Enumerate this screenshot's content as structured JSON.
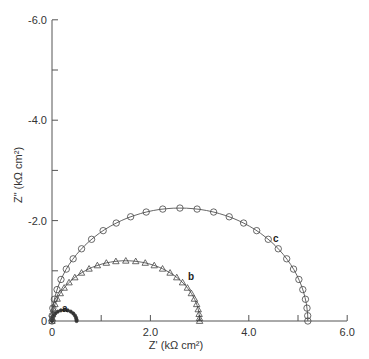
{
  "chart_data": {
    "type": "scatter",
    "title": "",
    "xlabel": "Z' (kΩ cm²)",
    "ylabel": "Z\" (kΩ cm²)",
    "xlim": [
      0,
      6.0
    ],
    "ylim": [
      0,
      -6.0
    ],
    "x_ticks": [
      "0",
      "2.0",
      "4.0",
      "6.0"
    ],
    "y_ticks": [
      "0",
      "-2.0",
      "-4.0",
      "-6.0"
    ],
    "grid": false,
    "legend": "none (curves labeled inline a, b, c)",
    "series": [
      {
        "name": "a",
        "marker": "filled-dot",
        "x_range": [
          0,
          0.5
        ],
        "peak": {
          "x": 0.22,
          "y": -0.22
        }
      },
      {
        "name": "b",
        "marker": "triangle",
        "x_range": [
          0,
          3.0
        ],
        "peak": {
          "x": 1.5,
          "y": -1.2
        }
      },
      {
        "name": "c",
        "marker": "circle",
        "x_range": [
          0,
          5.2
        ],
        "peak": {
          "x": 2.7,
          "y": -2.25
        }
      }
    ]
  },
  "labels": {
    "x_axis": "Z' (kΩ cm²)",
    "y_axis": "Z\" (kΩ cm²)",
    "a": "a",
    "b": "b",
    "c": "c",
    "x0": "0",
    "x2": "2.0",
    "x4": "4.0",
    "x6": "6.0",
    "y0": "0",
    "y2": "-2.0",
    "y4": "-4.0",
    "y6": "-6.0"
  }
}
